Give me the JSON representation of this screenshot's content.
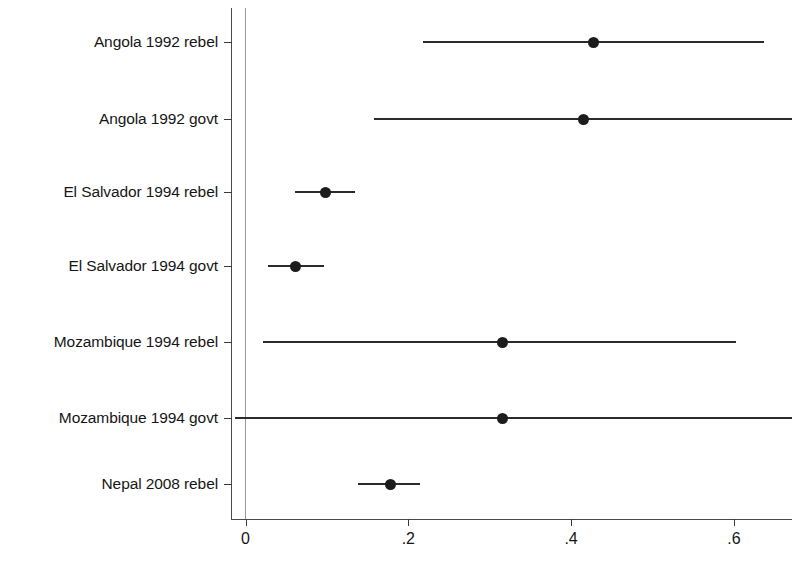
{
  "chart_data": {
    "type": "scatter",
    "subtype": "forest-plot",
    "title": "",
    "xlabel": "",
    "ylabel": "",
    "xlim": [
      -0.018,
      0.672
    ],
    "xticks": [
      0,
      0.2,
      0.4,
      0.6
    ],
    "xtick_labels": [
      "0",
      ".2",
      ".4",
      ".6"
    ],
    "grid": false,
    "legend": null,
    "reference_line_x": 0,
    "categories": [
      "Angola 1992 rebel",
      "Angola 1992 govt",
      "El Salvador 1994 rebel",
      "El Salvador 1994 govt",
      "Mozambique 1994 rebel",
      "Mozambique 1994 govt",
      "Nepal 2008 rebel"
    ],
    "points": [
      {
        "label": "Angola 1992 rebel",
        "estimate": 0.427,
        "ci_low": 0.218,
        "ci_high": 0.637
      },
      {
        "label": "Angola 1992 govt",
        "estimate": 0.415,
        "ci_low": 0.158,
        "ci_high": 0.672
      },
      {
        "label": "El Salvador 1994 rebel",
        "estimate": 0.098,
        "ci_low": 0.061,
        "ci_high": 0.135
      },
      {
        "label": "El Salvador 1994 govt",
        "estimate": 0.061,
        "ci_low": 0.028,
        "ci_high": 0.097
      },
      {
        "label": "Mozambique 1994 rebel",
        "estimate": 0.316,
        "ci_low": 0.021,
        "ci_high": 0.603
      },
      {
        "label": "Mozambique 1994 govt",
        "estimate": 0.316,
        "ci_low": -0.013,
        "ci_high": 0.672
      },
      {
        "label": "Nepal 2008 rebel",
        "estimate": 0.178,
        "ci_low": 0.138,
        "ci_high": 0.214
      }
    ]
  },
  "axis": {
    "x_tick_labels": [
      "0",
      ".2",
      ".4",
      ".6"
    ]
  },
  "rows": [
    {
      "label": "Angola 1992 rebel"
    },
    {
      "label": "Angola 1992 govt"
    },
    {
      "label": "El Salvador 1994 rebel"
    },
    {
      "label": "El Salvador 1994 govt"
    },
    {
      "label": "Mozambique 1994 rebel"
    },
    {
      "label": "Mozambique 1994 govt"
    },
    {
      "label": "Nepal 2008 rebel"
    }
  ],
  "colors": {
    "point": "#1c1c1c",
    "line": "#2b2b2b",
    "axis": "#4a4a4a",
    "reference": "#9a9a9a",
    "text": "#161616",
    "background": "#ffffff"
  }
}
